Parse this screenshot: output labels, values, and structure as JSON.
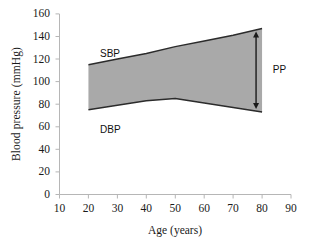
{
  "chart_data": {
    "type": "area",
    "title": "",
    "xlabel": "Age (years)",
    "ylabel": "Blood pressure (mmHg)",
    "xlim": [
      10,
      90
    ],
    "ylim": [
      0,
      160
    ],
    "xticks": [
      10,
      20,
      30,
      40,
      50,
      60,
      70,
      80,
      90
    ],
    "yticks": [
      0,
      20,
      40,
      60,
      80,
      100,
      120,
      140,
      160
    ],
    "grid": false,
    "legend": "none",
    "x": [
      20,
      30,
      40,
      50,
      60,
      70,
      80
    ],
    "series": [
      {
        "name": "SBP",
        "label": "SBP",
        "values": [
          115,
          120,
          125,
          131,
          136,
          141,
          147
        ]
      },
      {
        "name": "DBP",
        "label": "DBP",
        "values": [
          75,
          79,
          83,
          85,
          81,
          77,
          73
        ]
      }
    ],
    "band": {
      "upper_series": "SBP",
      "lower_series": "DBP",
      "fill_color": "#a9a9a9",
      "line_color": "#2b2b2b"
    },
    "annotations": [
      {
        "name": "sbp-label",
        "text": "SBP",
        "x": 24,
        "y": 124,
        "style": "sans"
      },
      {
        "name": "dbp-label",
        "text": "DBP",
        "x": 24,
        "y": 63,
        "style": "sans"
      },
      {
        "name": "pp-label",
        "text": "PP",
        "x": 83,
        "y": 110,
        "style": "sans"
      }
    ],
    "arrow": {
      "name": "pp-arrow",
      "text": "PP",
      "x": 80,
      "y_top": 147,
      "y_bottom": 73,
      "double_headed": true,
      "color": "#1a1a1a"
    },
    "axis_color": "#b6b6b6",
    "tick_label_color": "#1a1a1a",
    "background": "#ffffff"
  },
  "labels": {
    "ylabel": "Blood pressure (mmHg)",
    "xlabel": "Age (years)",
    "sbp": "SBP",
    "dbp": "DBP",
    "pp": "PP",
    "y": {
      "t0": "0",
      "t1": "20",
      "t2": "40",
      "t3": "60",
      "t4": "80",
      "t5": "100",
      "t6": "120",
      "t7": "140",
      "t8": "160"
    },
    "x": {
      "t0": "10",
      "t1": "20",
      "t2": "30",
      "t3": "40",
      "t4": "50",
      "t5": "60",
      "t6": "70",
      "t7": "80",
      "t8": "90"
    }
  }
}
